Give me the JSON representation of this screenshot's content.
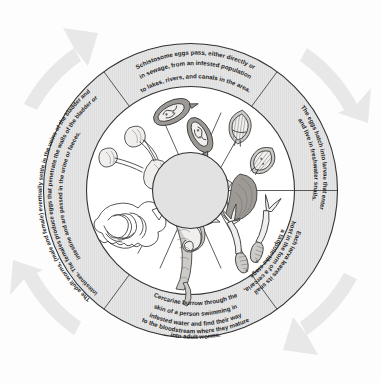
{
  "diagram": {
    "type": "cycle-wheel",
    "direction": "clockwise",
    "colors": {
      "band_fill": "#e4e4e4",
      "inner_fill": "#ffffff",
      "hub_fill": "#e2e2e2",
      "outline": "#333333",
      "arrow_fill": "#e8e8e8",
      "text": "#232323"
    },
    "segments": [
      {
        "id": "eggs-pass",
        "position": "top",
        "caption_lines": [
          "Schistosome eggs pass, either directly or",
          "in sewage, from an infested population",
          "to lakes, rivers, and canals in the area."
        ],
        "illustration": "schistosome-eggs"
      },
      {
        "id": "eggs-hatch",
        "position": "upper-right",
        "caption_lines": [
          "The eggs hatch into larvae that enter",
          "and live in freshwater snails."
        ],
        "illustration": "miracidia-and-snail"
      },
      {
        "id": "larva-leaves-snail",
        "position": "lower-right",
        "caption_lines": [
          "Each larva leaves its snail",
          "host in the form of a cercaria,",
          "a tadpole-like stage."
        ],
        "illustration": "fork-tailed-cercariae"
      },
      {
        "id": "cercariae-burrow",
        "position": "bottom",
        "caption_lines": [
          "Cercariae burrow through the",
          "skin of a person swimming in",
          "infested water and find their way",
          "to the bloodstream where they mature",
          "into adult worms."
        ],
        "illustration": "adult-worm-pair"
      },
      {
        "id": "adult-worms-settle",
        "position": "left",
        "caption_lines": [
          "The adult worms, (male and female) eventually settle in the veins of the bladder and",
          "intestines. The females produce eggs that penetrate the walls of the bladder or",
          "intestine and are passed in the urine or faeces."
        ],
        "illustration_upper": "kidneys-ureters-bladder",
        "illustration_lower": "intestine-with-worms"
      }
    ],
    "arrows": [
      {
        "id": "arrow-top-left",
        "direction": "clockwise",
        "points": "up-right"
      },
      {
        "id": "arrow-top-right",
        "direction": "clockwise",
        "points": "down-right"
      },
      {
        "id": "arrow-bottom-right",
        "direction": "clockwise",
        "points": "down-left"
      },
      {
        "id": "arrow-bottom-left",
        "direction": "clockwise",
        "points": "up-left"
      }
    ]
  }
}
